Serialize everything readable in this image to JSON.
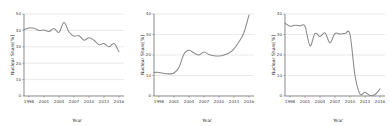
{
  "figure": {
    "panel_count": 3,
    "line_color": "#8a8a8a",
    "grid_color": "#d4d4d4",
    "axis_color": "#6d6d6d",
    "background": "#ffffff"
  },
  "chart_data": [
    {
      "type": "line",
      "title": "",
      "xlabel": "Year",
      "ylabel": "Nuclear Share[%]",
      "xlim": [
        1997,
        2017
      ],
      "ylim": [
        0,
        50
      ],
      "xticks": [
        1998,
        2001,
        2004,
        2007,
        2010,
        2013,
        2016
      ],
      "xticklabels": [
        "1998",
        "2001",
        "2004",
        "2007",
        "2010",
        "2013",
        "2016"
      ],
      "yticks": [
        0,
        10,
        20,
        30,
        40,
        50
      ],
      "yticklabels": [
        "0",
        "10",
        "20",
        "30",
        "40",
        "50"
      ],
      "grid": true,
      "legend": "none",
      "x": [
        1997,
        1998,
        1999,
        2000,
        2001,
        2002,
        2003,
        2004,
        2005,
        2006,
        2007,
        2008,
        2009,
        2010,
        2011,
        2012,
        2013,
        2014,
        2015,
        2016
      ],
      "values": [
        40.5,
        41.5,
        41.3,
        40.0,
        40.2,
        39.3,
        41.2,
        38.8,
        44.8,
        39.0,
        36.5,
        36.8,
        34.0,
        35.5,
        34.0,
        31.3,
        32.0,
        30.0,
        32.0,
        27.0
      ]
    },
    {
      "type": "line",
      "title": "",
      "xlabel": "Year",
      "ylabel": "Nuclear Share[%]",
      "xlim": [
        1997,
        2017
      ],
      "ylim": [
        0,
        40
      ],
      "xticks": [
        1998,
        2001,
        2004,
        2007,
        2010,
        2013,
        2016
      ],
      "xticklabels": [
        "1998",
        "2001",
        "2004",
        "2007",
        "2010",
        "2013",
        "2016"
      ],
      "yticks": [
        0,
        10,
        20,
        30,
        40
      ],
      "yticklabels": [
        "0",
        "10",
        "20",
        "30",
        "40"
      ],
      "grid": true,
      "legend": "none",
      "x": [
        1997,
        1998,
        1999,
        2000,
        2001,
        2002,
        2003,
        2004,
        2005,
        2006,
        2007,
        2008,
        2009,
        2010,
        2011,
        2012,
        2013,
        2014,
        2015,
        2016
      ],
      "values": [
        11.5,
        11.5,
        11.0,
        10.8,
        11.2,
        14.0,
        20.5,
        22.3,
        21.0,
        20.0,
        21.5,
        20.2,
        19.6,
        19.5,
        20.0,
        21.0,
        23.0,
        26.5,
        31.0,
        39.5
      ]
    },
    {
      "type": "line",
      "title": "",
      "xlabel": "Year",
      "ylabel": "Nuclear Share[%]",
      "xlim": [
        1997,
        2017
      ],
      "ylim": [
        0,
        40
      ],
      "xticks": [
        1998,
        2001,
        2004,
        2007,
        2010,
        2013,
        2016
      ],
      "xticklabels": [
        "1998",
        "2001",
        "2004",
        "2007",
        "2010",
        "2013",
        "2016"
      ],
      "yticks": [
        0,
        10,
        20,
        30,
        40
      ],
      "yticklabels": [
        "0",
        "10",
        "20",
        "30",
        "40"
      ],
      "grid": true,
      "legend": "none",
      "x": [
        1997,
        1998,
        1999,
        2000,
        2001,
        2002,
        2003,
        2004,
        2005,
        2006,
        2007,
        2008,
        2009,
        2010,
        2011,
        2012,
        2013,
        2014,
        2015,
        2016
      ],
      "values": [
        35.5,
        34.0,
        34.5,
        34.2,
        34.0,
        24.5,
        30.5,
        29.0,
        30.8,
        26.0,
        30.5,
        30.2,
        30.5,
        30.0,
        10.0,
        1.0,
        1.8,
        0.3,
        0.7,
        3.5
      ]
    }
  ]
}
